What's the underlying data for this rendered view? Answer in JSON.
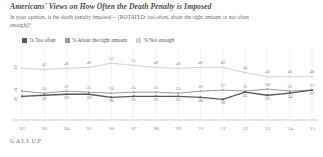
{
  "header": {
    "title": "Americans' Views on How Often the Death Penalty is Imposed",
    "subtitle": "In your opinion, is the death penalty imposed -- [ROTATED: too often, about the right amount or not often enough]?"
  },
  "footer": {
    "brand": "GALLUP"
  },
  "colors": {
    "too_often": "#595959",
    "about_right": "#9a9a9a",
    "not_enough": "#d2d2d2",
    "axis": "#bdbdbd",
    "grid": "#e3e3e3"
  },
  "chart_data": {
    "type": "line",
    "title": "Americans' Views on How Often the Death Penalty is Imposed",
    "xlabel": "",
    "ylabel": "",
    "ylim": [
      0,
      60
    ],
    "grid": true,
    "legend_position": "top-left",
    "categories": [
      "'02",
      "'03",
      "'04",
      "'05",
      "'06",
      "'07",
      "'08",
      "'09",
      "'10",
      "'11",
      "'12",
      "'13",
      "'14",
      "'15"
    ],
    "series": [
      {
        "name": "% Too often",
        "color": "#595959",
        "values": [
          21,
          22,
          23,
          23,
          20,
          21,
          21,
          21,
          20,
          18,
          25,
          22,
          24,
          27
        ]
      },
      {
        "name": "% About the right amount",
        "color": "#9a9a9a",
        "values": [
          26,
          24,
          26,
          25,
          24,
          25,
          25,
          24,
          26,
          27,
          26,
          28,
          26,
          27
        ]
      },
      {
        "name": "% Not enough",
        "color": "#d2d2d2",
        "values": [
          48,
          47,
          48,
          49,
          53,
          51,
          49,
          48,
          49,
          49,
          44,
          40,
          40,
          40
        ]
      }
    ],
    "first_point_labels": [
      "48",
      "26",
      "21"
    ],
    "legend": [
      {
        "label": "% Too often",
        "color": "#595959"
      },
      {
        "label": "% About the right amount",
        "color": "#9a9a9a"
      },
      {
        "label": "% Not enough",
        "color": "#d2d2d2"
      }
    ]
  }
}
